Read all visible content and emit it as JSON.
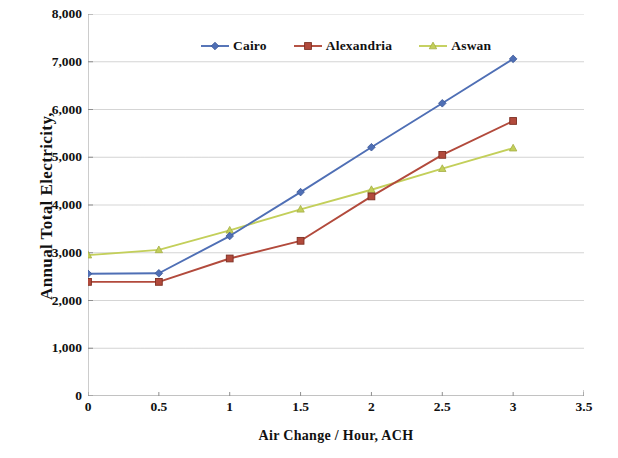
{
  "chart_data": {
    "type": "line",
    "title": "",
    "xlabel": "Air Change / Hour, ACH",
    "ylabel": "Annual Total Electricity,",
    "xlim": [
      0,
      3.5
    ],
    "ylim": [
      0,
      8000
    ],
    "x": [
      0,
      0.5,
      1,
      1.5,
      2,
      2.5,
      3
    ],
    "xticks": [
      "0",
      "0.5",
      "1",
      "1.5",
      "2",
      "2.5",
      "3",
      "3.5"
    ],
    "xtick_values": [
      0,
      0.5,
      1,
      1.5,
      2,
      2.5,
      3,
      3.5
    ],
    "yticks": [
      "0",
      "1,000",
      "2,000",
      "3,000",
      "4,000",
      "5,000",
      "6,000",
      "7,000",
      "8,000"
    ],
    "ytick_values": [
      0,
      1000,
      2000,
      3000,
      4000,
      5000,
      6000,
      7000,
      8000
    ],
    "grid": true,
    "grid_axis": "y",
    "legend_position": "top-center",
    "series": [
      {
        "name": "Cairo",
        "color": "#4f6fb5",
        "marker": "diamond",
        "values": [
          2560,
          2570,
          3350,
          4270,
          5210,
          6130,
          7060
        ]
      },
      {
        "name": "Alexandria",
        "color": "#b24a3c",
        "marker": "square",
        "values": [
          2390,
          2390,
          2880,
          3250,
          4180,
          5050,
          5760
        ]
      },
      {
        "name": "Aswan",
        "color": "#c3cf5a",
        "marker": "triangle",
        "values": [
          2950,
          3060,
          3470,
          3910,
          4320,
          4760,
          5190
        ]
      }
    ]
  },
  "axes": {
    "y_title": "Annual Total Electricity,",
    "x_title": "Air Change / Hour, ACH"
  },
  "legend": {
    "items": [
      {
        "label": "Cairo"
      },
      {
        "label": "Alexandria"
      },
      {
        "label": "Aswan"
      }
    ]
  }
}
